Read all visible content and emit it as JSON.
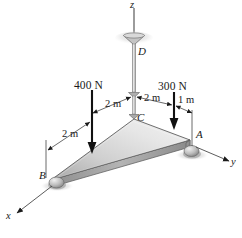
{
  "figure": {
    "type": "engineering-statics-free-body-diagram",
    "background_color": "#ffffff",
    "plate_color_light": "#e8e8e8",
    "plate_color_mid": "#c9c9c9",
    "plate_color_dark": "#9a9a9a",
    "line_color": "#1a1a1a",
    "axes": [
      {
        "name": "z-axis",
        "label": "z",
        "direction": "up"
      },
      {
        "name": "y-axis",
        "label": "y",
        "direction": "right-down"
      },
      {
        "name": "x-axis",
        "label": "x",
        "direction": "left-down"
      }
    ],
    "points": [
      {
        "name": "point-a",
        "label": "A",
        "support": "ball-roller"
      },
      {
        "name": "point-b",
        "label": "B",
        "support": "ball-roller"
      },
      {
        "name": "point-c",
        "label": "C",
        "support": "cable-attachment"
      },
      {
        "name": "point-d",
        "label": "D",
        "support": "ceiling-anchor"
      }
    ],
    "forces": [
      {
        "name": "force-400n",
        "label": "400 N",
        "magnitude": 400,
        "unit": "N",
        "direction": "down"
      },
      {
        "name": "force-300n",
        "label": "300 N",
        "magnitude": 300,
        "unit": "N",
        "direction": "down"
      }
    ],
    "dimensions": [
      {
        "name": "dim-b-left",
        "label": "2 m",
        "value": 2,
        "unit": "m"
      },
      {
        "name": "dim-c-left",
        "label": "2 m",
        "value": 2,
        "unit": "m"
      },
      {
        "name": "dim-c-right",
        "label": "2 m",
        "value": 2,
        "unit": "m"
      },
      {
        "name": "dim-a-right",
        "label": "1 m",
        "value": 1,
        "unit": "m"
      }
    ]
  }
}
